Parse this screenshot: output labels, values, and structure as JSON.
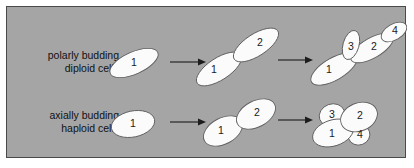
{
  "figure": {
    "background_color": "#a5a5a5",
    "border_color": "#4a4a4a",
    "cell_fill_color": "#fbfbfb",
    "cell_stroke_color": "#5f5f5f",
    "arrow_color": "#1d1d1d",
    "text_color": "#111111"
  },
  "rows": [
    {
      "id": "diploid",
      "label_line1": "polarly budding",
      "label_line2": "diploid cells",
      "stages": [
        {
          "cells": [
            "1"
          ]
        },
        {
          "cells": [
            "1",
            "2"
          ]
        },
        {
          "cells": [
            "1",
            "3",
            "2",
            "4"
          ]
        }
      ]
    },
    {
      "id": "haploid",
      "label_line1": "axially budding",
      "label_line2": "haploid cells",
      "stages": [
        {
          "cells": [
            "1"
          ]
        },
        {
          "cells": [
            "1",
            "2"
          ]
        },
        {
          "cells": [
            "1",
            "3",
            "2",
            "4"
          ]
        }
      ]
    }
  ],
  "cells": {
    "diploid": {
      "s1_c1": "1",
      "s2_c1": "1",
      "s2_c2": "2",
      "s3_c1": "1",
      "s3_c2": "2",
      "s3_c3": "3",
      "s3_c4": "4"
    },
    "haploid": {
      "s1_c1": "1",
      "s2_c1": "1",
      "s2_c2": "2",
      "s3_c1": "1",
      "s3_c2": "2",
      "s3_c3": "3",
      "s3_c4": "4"
    }
  }
}
